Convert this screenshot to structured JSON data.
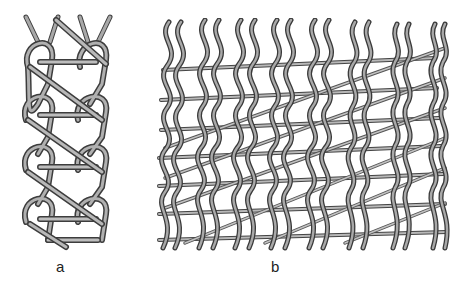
{
  "figure": {
    "panels": [
      {
        "id": "a",
        "label": "a",
        "description": "single-column knitted wire loop structure (two wales)"
      },
      {
        "id": "b",
        "label": "b",
        "description": "knitted wire mesh fabric with multiple wales"
      }
    ]
  },
  "colors": {
    "wire": "#8a8a8a",
    "wire_dark": "#3c3c3c",
    "wire_light": "#d0d0d0",
    "background": "#ffffff",
    "label": "#222222"
  },
  "panel_b": {
    "wale_count": 9,
    "course_count": 8
  }
}
